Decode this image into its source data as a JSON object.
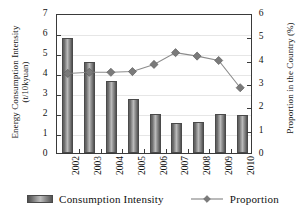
{
  "chart_data": {
    "type": "bar",
    "title": "",
    "subtitle": "",
    "xlabel": "",
    "ylabel": "Energy Consumption Intensity (t/10kyuan)",
    "y2label": "Proportion in the Country (%)",
    "categories": [
      "2002",
      "2003",
      "2004",
      "2005",
      "2006",
      "2007",
      "2008",
      "2009",
      "2010"
    ],
    "grid": true,
    "legend_position": "bottom",
    "ylim": [
      0,
      7
    ],
    "y2lim": [
      0,
      6
    ],
    "yticks": [
      "0",
      "1",
      "2",
      "3",
      "4",
      "5",
      "6",
      "7"
    ],
    "y2ticks": [
      "0",
      "1",
      "2",
      "3",
      "4",
      "5",
      "6"
    ],
    "series": [
      {
        "name": "Consumption Intensity",
        "type": "bar",
        "axis": "left",
        "values": [
          5.75,
          4.55,
          3.6,
          2.72,
          1.93,
          1.52,
          1.57,
          1.97,
          1.88
        ]
      },
      {
        "name": "Proportion",
        "type": "line",
        "axis": "right",
        "marker": "diamond",
        "values": [
          3.47,
          3.52,
          3.52,
          3.55,
          3.86,
          4.37,
          4.22,
          4.03,
          2.85
        ]
      }
    ]
  },
  "axes": {
    "left_title_line1": "Energy Consumption Intensity",
    "left_title_line2": "(t/10kyuan)",
    "right_title": "Proportion in the Country (%)"
  },
  "legend": {
    "items": [
      {
        "label": "Consumption Intensity",
        "marker": "bar-swatch"
      },
      {
        "label": "Proportion",
        "marker": "line-diamond"
      }
    ]
  },
  "colors": {
    "bar_edge": "#4a4a4a",
    "bar_fill_light": "#bdbdbd",
    "bar_fill_dark": "#4f4f4f",
    "line": "#8c8c8c",
    "marker": "#7a7a7a",
    "axis": "#3a3a3a",
    "grid": "#e6e6e6",
    "text": "#111111"
  }
}
